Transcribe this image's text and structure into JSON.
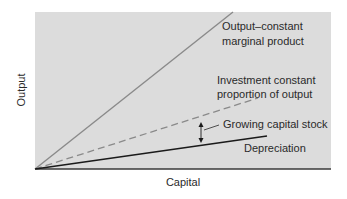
{
  "diagram": {
    "axes": {
      "xlabel": "Capital",
      "ylabel": "Output"
    },
    "lines": {
      "output": {
        "label_line1": "Output–constant",
        "label_line2": "marginal product",
        "style": "solid",
        "color": "#8a8a8a"
      },
      "investment": {
        "label_line1": "Investment constant",
        "label_line2": "proportion of output",
        "style": "dashed",
        "color": "#8a8a8a"
      },
      "depreciation": {
        "label": "Depreciation",
        "style": "solid",
        "color": "#1a1a1a"
      }
    },
    "annotation": {
      "label": "Growing capital stock"
    },
    "colors": {
      "plot_background": "#dcdcdc",
      "axis": "#3a3a3a",
      "text": "#2a2a2a"
    }
  }
}
